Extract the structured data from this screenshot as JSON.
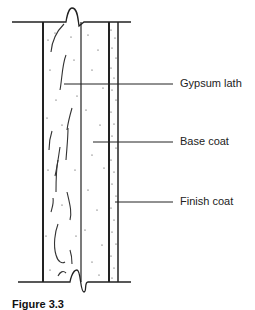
{
  "diagram": {
    "layers": [
      {
        "name": "Gypsum lath",
        "x_left": 43,
        "x_right": 81,
        "texture": "fibrous squiggles with sparse dots"
      },
      {
        "name": "Base coat",
        "x_left": 81,
        "x_right": 109,
        "texture": "sparse dots"
      },
      {
        "name": "Finish coat",
        "x_left": 109,
        "x_right": 118,
        "texture": "dense dots"
      }
    ],
    "labels": [
      {
        "text": "Gypsum lath",
        "leader_y": 84
      },
      {
        "text": "Base coat",
        "leader_y": 142
      },
      {
        "text": "Finish coat",
        "leader_y": 202
      }
    ],
    "colors": {
      "ink": "#222222",
      "background": "#ffffff"
    }
  },
  "caption": {
    "text": "Figure 3.3"
  }
}
